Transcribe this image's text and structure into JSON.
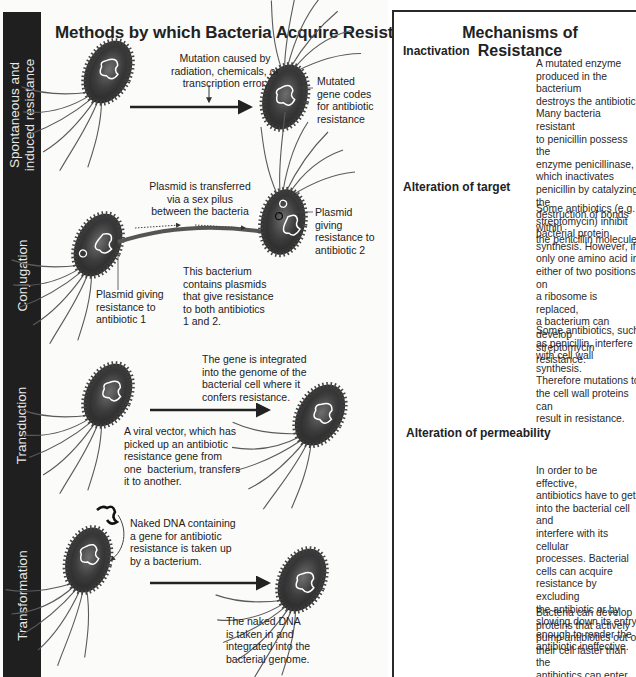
{
  "left_panel": {
    "title": "Methods by which Bacteria Acquire Resistance",
    "side_labels": {
      "spontaneous_line1": "Spontaneous and",
      "spontaneous_line2": "induced resistance",
      "conjugation": "Conjugation",
      "transduction": "Transduction",
      "transformation": "Transformation"
    },
    "spontaneous": {
      "cause_line1": "Mutation caused by",
      "cause_line2": "radiation, chemicals, or",
      "cause_line3": "transcription error.",
      "result_line1": "Mutated",
      "result_line2": "gene codes",
      "result_line3": "for antibiotic",
      "result_line4": "resistance"
    },
    "conjugation": {
      "transfer_line1": "Plasmid is transferred",
      "transfer_line2": "via a sex pilus",
      "transfer_line3": "between the bacteria",
      "plasmid2_line1": "Plasmid",
      "plasmid2_line2": "giving",
      "plasmid2_line3": "resistance to",
      "plasmid2_line4": "antibiotic 2",
      "plasmid1_line1": "Plasmid giving",
      "plasmid1_line2": "resistance to",
      "plasmid1_line3": "antibiotic 1",
      "both_line1": "This bacterium",
      "both_line2": "contains plasmids",
      "both_line3": "that give resistance",
      "both_line4": "to both antibiotics",
      "both_line5": "1 and 2."
    },
    "transduction": {
      "integrated_line1": "The gene is integrated",
      "integrated_line2": "into the genome of the",
      "integrated_line3": "bacterial cell where it",
      "integrated_line4": "confers resistance.",
      "vector_line1": "A viral vector, which has",
      "vector_line2": "picked up an antibiotic",
      "vector_line3": "resistance gene from",
      "vector_line4": "one  bacterium, transfers",
      "vector_line5": "it to another."
    },
    "transformation": {
      "naked_line1": "Naked DNA containing",
      "naked_line2": "a gene for antibiotic",
      "naked_line3": "resistance is taken up",
      "naked_line4": "by a bacterium.",
      "taken_line1": "The naked DNA",
      "taken_line2": "is taken in and",
      "taken_line3": "integrated into the",
      "taken_line4": "bacterial genome."
    }
  },
  "right_panel": {
    "title": "Mechanisms of Resistance",
    "inactivation": {
      "heading": "Inactivation",
      "lines": [
        "A mutated enzyme",
        "produced in the bacterium",
        "destroys the antibiotic.",
        "Many bacteria resistant",
        "to penicillin possess the",
        "enzyme penicillinase,",
        "which inactivates",
        "penicillin by catalyzing the",
        "destruction of bonds within",
        "the penicillin molecule."
      ]
    },
    "alteration_target": {
      "heading": "Alteration of target",
      "text1_lines": [
        "Some antibiotics (e.g.",
        "streptomycin) inhibit",
        "bacterial protein",
        "synthesis. However, if",
        "only one amino acid in",
        "either of two positions on",
        "a ribosome is replaced,",
        "a bacterium can develop",
        "streptomycin resistance."
      ],
      "text2_lines": [
        "Some antibiotics, such",
        "as penicillin, interfere",
        "with cell wall synthesis.",
        "Therefore mutations to",
        "the cell wall proteins can",
        "result in resistance."
      ]
    },
    "alteration_permeability": {
      "heading": "Alteration of permeability",
      "text1_lines": [
        "In order to be effective,",
        "antibiotics have to get",
        "into the bacterial cell and",
        "interfere with its cellular",
        "processes. Bacterial",
        "cells can acquire",
        "resistance by excluding",
        "the antibiotic or by",
        "slowing down its entry",
        "enough to render the",
        "antibiotic ineffective."
      ],
      "text2_lines": [
        "Bacteria can develop",
        "proteins that actively",
        "pump antibiotics out of",
        "their cell faster than the",
        "antibiotics can enter."
      ]
    }
  },
  "colors": {
    "sidebar": "#1f1f1f",
    "sidebar_text": "#e8e8e8",
    "text": "#222222",
    "border": "#2a2a2a",
    "bacterium_dark": "#3a3a3a",
    "bacterium_light": "#9a9a9a",
    "antibiotic": "#b5b5b5"
  }
}
